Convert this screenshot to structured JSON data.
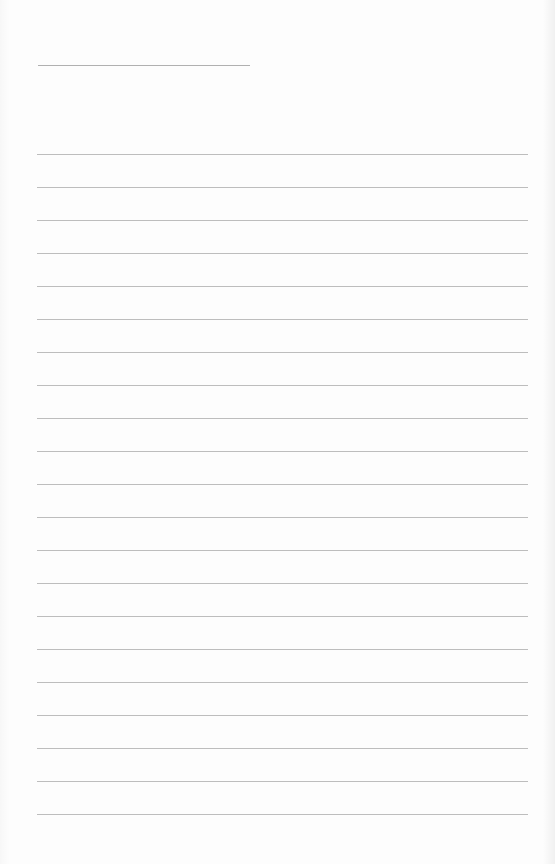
{
  "document": {
    "type": "lined paper",
    "title_line": {
      "text": ""
    },
    "ruled_line_count": 21,
    "lines": [
      "",
      "",
      "",
      "",
      "",
      "",
      "",
      "",
      "",
      "",
      "",
      "",
      "",
      "",
      "",
      "",
      "",
      "",
      "",
      "",
      ""
    ],
    "line_color": "#bdbdbd",
    "paper_color": "#fdfdfd"
  }
}
